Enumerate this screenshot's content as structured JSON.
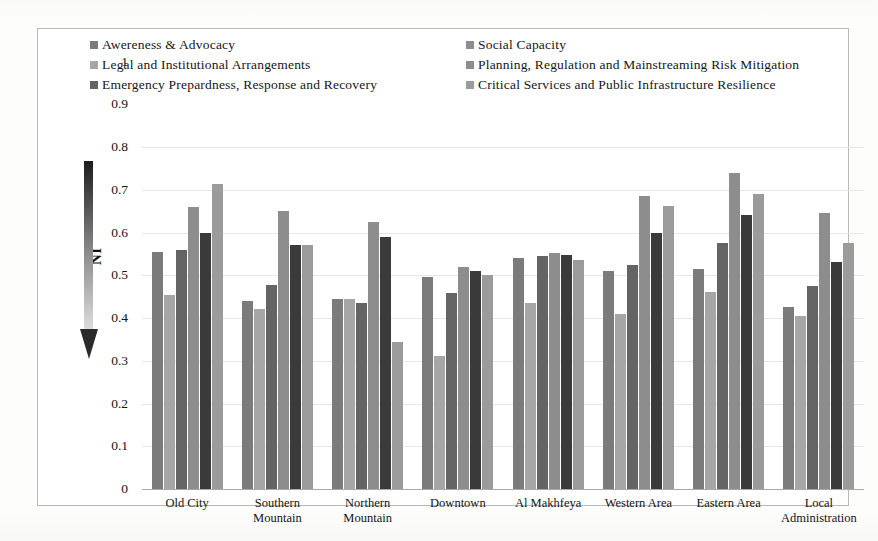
{
  "chart_data": {
    "type": "bar",
    "title": "",
    "xlabel": "",
    "ylabel": "NI",
    "ylim": [
      0,
      1
    ],
    "ytick_values": [
      "1",
      "0.9",
      "0.8",
      "0.7",
      "0.6",
      "0.5",
      "0.4",
      "0.3",
      "0.2",
      "0.1",
      "0"
    ],
    "grid": true,
    "legend_position": "top",
    "categories": [
      "Old City",
      "Southern Mountain",
      "Northern Mountain",
      "Downtown",
      "Al Makhfeya",
      "Western Area",
      "Eastern Area",
      "Local Administration"
    ],
    "series": [
      {
        "name": "Awereness & Advocacy",
        "color": "#7b7b7b",
        "values": [
          0.555,
          0.44,
          0.445,
          0.495,
          0.54,
          0.51,
          0.515,
          0.425
        ]
      },
      {
        "name": "Legal and Institutional Arrangements",
        "color": "#a6a6a6",
        "values": [
          0.455,
          0.42,
          0.445,
          0.31,
          0.435,
          0.41,
          0.46,
          0.405
        ]
      },
      {
        "name": "Emergency Prepardness, Response and Recovery",
        "color": "#646464",
        "values": [
          0.56,
          0.478,
          0.435,
          0.458,
          0.545,
          0.525,
          0.575,
          0.475
        ]
      },
      {
        "name": "Social Capacity",
        "color": "#8d8d8d",
        "values": [
          0.66,
          0.65,
          0.625,
          0.52,
          0.552,
          0.685,
          0.74,
          0.645
        ]
      },
      {
        "name": "Planning, Regulation and Mainstreaming Risk Mitigation",
        "color": "#3a3a3a",
        "values": [
          0.6,
          0.57,
          0.59,
          0.51,
          0.548,
          0.6,
          0.64,
          0.53
        ]
      },
      {
        "name": "Critical Services and Public Infrastructure Resilience",
        "color": "#9b9b9b",
        "values": [
          0.713,
          0.57,
          0.345,
          0.5,
          0.535,
          0.662,
          0.69,
          0.575
        ]
      }
    ]
  },
  "legend": {
    "left_items": [
      {
        "label": "Awereness & Advocacy",
        "swatch": "#7b7b7b"
      },
      {
        "label": "Legal and Institutional Arrangements",
        "swatch": "#a6a6a6"
      },
      {
        "label": "Emergency Prepardness, Response and Recovery",
        "swatch": "#646464"
      }
    ],
    "right_items": [
      {
        "label": "Social Capacity",
        "swatch": "#8d8d8d"
      },
      {
        "label": "Planning, Regulation and Mainstreaming Risk Mitigation",
        "swatch": "#8d8d8d"
      },
      {
        "label": "Critical Services and Public Infrastructure Resilience",
        "swatch": "#9b9b9b"
      }
    ]
  },
  "axes": {
    "y_title": "NI",
    "y_ticks": [
      "1",
      "0.9",
      "0.8",
      "0.7",
      "0.6",
      "0.5",
      "0.4",
      "0.3",
      "0.2",
      "0.1",
      "0"
    ],
    "x_categories": [
      [
        "Old City"
      ],
      [
        "Southern",
        "Mountain"
      ],
      [
        "Northern",
        "Mountain"
      ],
      [
        "Downtown"
      ],
      [
        "Al Makhfeya"
      ],
      [
        "Western Area"
      ],
      [
        "Eastern Area"
      ],
      [
        "Local",
        "Administration"
      ]
    ]
  },
  "decor": {
    "arrow_name": "downward-trend-arrow",
    "arrow_top_color": "#1c1c1c",
    "arrow_bottom_color": "#e8e8e8"
  }
}
